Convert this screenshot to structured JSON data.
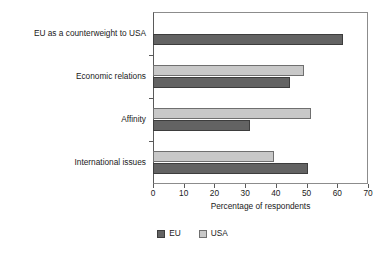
{
  "chart_data": {
    "type": "bar",
    "orientation": "horizontal",
    "title": "",
    "xlabel": "Percentage of respondents",
    "ylabel": "",
    "xlim": [
      0,
      70
    ],
    "xticks": [
      0,
      10,
      20,
      30,
      40,
      50,
      60,
      70
    ],
    "grid": false,
    "legend_position": "bottom",
    "categories": [
      "International issues",
      "Affinity",
      "Economic relations",
      "EU as a counterweight to USA"
    ],
    "series": [
      {
        "name": "EU",
        "color": "#636363",
        "values": [
          50.5,
          31.5,
          44.5,
          62
        ]
      },
      {
        "name": "USA",
        "color": "#c8c8c8",
        "values": [
          39.5,
          51.5,
          49,
          0
        ]
      }
    ]
  },
  "legend": {
    "items": [
      {
        "label": "EU",
        "swatch": "eu"
      },
      {
        "label": "USA",
        "swatch": "usa"
      }
    ]
  },
  "axis": {
    "x_title": "Percentage of respondents",
    "tick_labels": [
      "0",
      "10",
      "20",
      "30",
      "40",
      "50",
      "60",
      "70"
    ]
  }
}
